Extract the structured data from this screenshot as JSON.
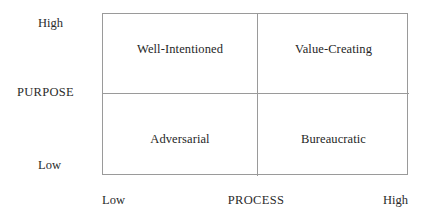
{
  "chart_data": {
    "type": "table",
    "title": "",
    "xlabel": "PROCESS",
    "ylabel": "PURPOSE",
    "x_ticks": [
      "Low",
      "High"
    ],
    "y_ticks": [
      "Low",
      "High"
    ],
    "grid": true,
    "legend": "none",
    "quadrants": [
      {
        "id": "top-left",
        "x": "Low",
        "y": "High",
        "label": "Well-Intentioned"
      },
      {
        "id": "top-right",
        "x": "High",
        "y": "High",
        "label": "Value-Creating"
      },
      {
        "id": "bottom-left",
        "x": "Low",
        "y": "Low",
        "label": "Adversarial"
      },
      {
        "id": "bottom-right",
        "x": "High",
        "y": "Low",
        "label": "Bureaucratic"
      }
    ]
  },
  "axes": {
    "y": {
      "title": "PURPOSE",
      "high_label": "High",
      "low_label": "Low"
    },
    "x": {
      "title": "PROCESS",
      "low_label": "Low",
      "high_label": "High"
    }
  },
  "colors": {
    "line": "#9a9a9a",
    "text": "#2b2b2b",
    "background": "#ffffff"
  }
}
